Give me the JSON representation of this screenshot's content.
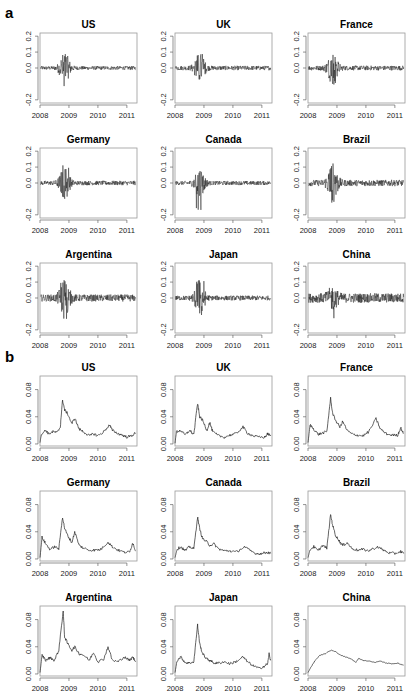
{
  "figure": {
    "panel_a_label": "a",
    "panel_b_label": "b"
  },
  "chart_data": [
    {
      "panel": "a",
      "type": "line",
      "description": "Daily stock index returns by country",
      "x_ticks": [
        "2008",
        "2009",
        "2010",
        "2011"
      ],
      "y_ticks": [
        "-0.2",
        "0.0",
        "0.1",
        "0.2"
      ],
      "ylim": [
        -0.22,
        0.22
      ],
      "xlim": [
        2008.0,
        2011.35
      ],
      "grid": false,
      "legend": null,
      "series": [
        {
          "name": "US",
          "amp_base": 0.012,
          "amp_crisis": 0.09,
          "crisis_min": -0.15,
          "crisis_max": 0.11
        },
        {
          "name": "UK",
          "amp_base": 0.014,
          "amp_crisis": 0.085,
          "crisis_min": -0.1,
          "crisis_max": 0.11
        },
        {
          "name": "France",
          "amp_base": 0.015,
          "amp_crisis": 0.09,
          "crisis_min": -0.12,
          "crisis_max": 0.12
        },
        {
          "name": "Germany",
          "amp_base": 0.014,
          "amp_crisis": 0.09,
          "crisis_min": -0.11,
          "crisis_max": 0.12
        },
        {
          "name": "Canada",
          "amp_base": 0.013,
          "amp_crisis": 0.09,
          "crisis_min": -0.17,
          "crisis_max": 0.1
        },
        {
          "name": "Brazil",
          "amp_base": 0.02,
          "amp_crisis": 0.11,
          "crisis_min": -0.17,
          "crisis_max": 0.14
        },
        {
          "name": "Argentina",
          "amp_base": 0.022,
          "amp_crisis": 0.1,
          "crisis_min": -0.17,
          "crisis_max": 0.11
        },
        {
          "name": "Japan",
          "amp_base": 0.015,
          "amp_crisis": 0.1,
          "crisis_min": -0.12,
          "crisis_max": 0.13
        },
        {
          "name": "China",
          "amp_base": 0.03,
          "amp_crisis": 0.05,
          "crisis_min": -0.13,
          "crisis_max": 0.09
        }
      ]
    },
    {
      "panel": "b",
      "type": "line",
      "description": "Estimated volatility by country",
      "x_ticks": [
        "2008",
        "2009",
        "2010",
        "2011"
      ],
      "y_ticks": [
        "0.00",
        "0.04",
        "0.08"
      ],
      "ylim": [
        -0.003,
        0.1
      ],
      "xlim": [
        2008.0,
        2011.35
      ],
      "grid": false,
      "legend": null,
      "series": [
        {
          "name": "US",
          "x": [
            2008.0,
            2008.05,
            2008.2,
            2008.3,
            2008.45,
            2008.6,
            2008.7,
            2008.78,
            2008.85,
            2008.95,
            2009.1,
            2009.2,
            2009.35,
            2009.5,
            2009.7,
            2009.85,
            2010.0,
            2010.2,
            2010.4,
            2010.5,
            2010.7,
            2010.85,
            2011.0,
            2011.15,
            2011.3
          ],
          "y": [
            0.002,
            0.015,
            0.02,
            0.015,
            0.018,
            0.017,
            0.025,
            0.065,
            0.05,
            0.045,
            0.03,
            0.038,
            0.022,
            0.018,
            0.012,
            0.015,
            0.012,
            0.018,
            0.028,
            0.02,
            0.015,
            0.013,
            0.01,
            0.012,
            0.016
          ]
        },
        {
          "name": "UK",
          "x": [
            2008.0,
            2008.05,
            2008.2,
            2008.35,
            2008.5,
            2008.65,
            2008.78,
            2008.85,
            2008.95,
            2009.1,
            2009.2,
            2009.3,
            2009.5,
            2009.7,
            2009.9,
            2010.1,
            2010.35,
            2010.5,
            2010.7,
            2010.9,
            2011.1,
            2011.2,
            2011.3
          ],
          "y": [
            0.001,
            0.018,
            0.02,
            0.013,
            0.02,
            0.014,
            0.06,
            0.04,
            0.035,
            0.02,
            0.032,
            0.018,
            0.012,
            0.01,
            0.013,
            0.015,
            0.025,
            0.016,
            0.012,
            0.01,
            0.01,
            0.015,
            0.012
          ]
        },
        {
          "name": "France",
          "x": [
            2008.0,
            2008.07,
            2008.2,
            2008.35,
            2008.5,
            2008.65,
            2008.78,
            2008.85,
            2008.95,
            2009.1,
            2009.2,
            2009.35,
            2009.5,
            2009.7,
            2009.9,
            2010.1,
            2010.35,
            2010.5,
            2010.7,
            2010.9,
            2011.1,
            2011.2,
            2011.3
          ],
          "y": [
            0.002,
            0.028,
            0.022,
            0.014,
            0.016,
            0.018,
            0.067,
            0.045,
            0.035,
            0.025,
            0.033,
            0.02,
            0.015,
            0.013,
            0.012,
            0.018,
            0.037,
            0.022,
            0.015,
            0.013,
            0.013,
            0.024,
            0.015
          ]
        },
        {
          "name": "Germany",
          "x": [
            2008.0,
            2008.07,
            2008.2,
            2008.35,
            2008.5,
            2008.65,
            2008.78,
            2008.85,
            2008.95,
            2009.1,
            2009.2,
            2009.35,
            2009.5,
            2009.7,
            2009.9,
            2010.1,
            2010.35,
            2010.5,
            2010.7,
            2010.9,
            2011.1,
            2011.2,
            2011.3
          ],
          "y": [
            0.002,
            0.032,
            0.022,
            0.014,
            0.018,
            0.015,
            0.062,
            0.045,
            0.035,
            0.024,
            0.04,
            0.02,
            0.016,
            0.013,
            0.013,
            0.014,
            0.025,
            0.018,
            0.013,
            0.01,
            0.01,
            0.024,
            0.012
          ]
        },
        {
          "name": "Canada",
          "x": [
            2008.0,
            2008.07,
            2008.2,
            2008.35,
            2008.5,
            2008.65,
            2008.78,
            2008.85,
            2008.95,
            2009.1,
            2009.2,
            2009.35,
            2009.5,
            2009.7,
            2009.9,
            2010.1,
            2010.4,
            2010.6,
            2010.8,
            2011.0,
            2011.2,
            2011.3
          ],
          "y": [
            0.002,
            0.014,
            0.018,
            0.012,
            0.018,
            0.015,
            0.062,
            0.045,
            0.03,
            0.025,
            0.02,
            0.022,
            0.015,
            0.012,
            0.012,
            0.01,
            0.018,
            0.012,
            0.008,
            0.008,
            0.01,
            0.008
          ]
        },
        {
          "name": "Brazil",
          "x": [
            2008.0,
            2008.07,
            2008.2,
            2008.35,
            2008.5,
            2008.65,
            2008.78,
            2008.85,
            2008.95,
            2009.1,
            2009.2,
            2009.35,
            2009.5,
            2009.7,
            2009.9,
            2010.1,
            2010.4,
            2010.6,
            2010.8,
            2011.0,
            2011.2,
            2011.3
          ],
          "y": [
            0.002,
            0.014,
            0.018,
            0.012,
            0.02,
            0.016,
            0.065,
            0.05,
            0.035,
            0.025,
            0.02,
            0.024,
            0.016,
            0.013,
            0.014,
            0.012,
            0.018,
            0.013,
            0.009,
            0.008,
            0.011,
            0.008
          ]
        },
        {
          "name": "Argentina",
          "x": [
            2008.0,
            2008.07,
            2008.2,
            2008.35,
            2008.5,
            2008.65,
            2008.8,
            2008.85,
            2008.95,
            2009.1,
            2009.2,
            2009.35,
            2009.5,
            2009.7,
            2009.85,
            2010.0,
            2010.2,
            2010.35,
            2010.5,
            2010.7,
            2010.9,
            2011.1,
            2011.2,
            2011.3
          ],
          "y": [
            0.002,
            0.028,
            0.02,
            0.024,
            0.02,
            0.035,
            0.093,
            0.055,
            0.045,
            0.035,
            0.04,
            0.03,
            0.028,
            0.02,
            0.032,
            0.018,
            0.022,
            0.04,
            0.02,
            0.018,
            0.025,
            0.02,
            0.025,
            0.018
          ]
        },
        {
          "name": "Japan",
          "x": [
            2008.0,
            2008.07,
            2008.2,
            2008.35,
            2008.5,
            2008.65,
            2008.78,
            2008.85,
            2008.95,
            2009.1,
            2009.2,
            2009.35,
            2009.5,
            2009.7,
            2009.9,
            2010.1,
            2010.35,
            2010.5,
            2010.7,
            2010.9,
            2011.1,
            2011.2,
            2011.25,
            2011.3
          ],
          "y": [
            0.002,
            0.02,
            0.025,
            0.017,
            0.016,
            0.018,
            0.072,
            0.045,
            0.03,
            0.022,
            0.02,
            0.016,
            0.016,
            0.018,
            0.015,
            0.018,
            0.025,
            0.018,
            0.012,
            0.008,
            0.012,
            0.015,
            0.03,
            0.02
          ]
        },
        {
          "name": "China",
          "x": [
            2008.0,
            2008.1,
            2008.25,
            2008.4,
            2008.6,
            2008.8,
            2008.95,
            2009.1,
            2009.3,
            2009.5,
            2009.65,
            2009.75,
            2009.9,
            2010.1,
            2010.3,
            2010.5,
            2010.7,
            2010.9,
            2011.1,
            2011.2,
            2011.3
          ],
          "y": [
            0.002,
            0.01,
            0.02,
            0.027,
            0.03,
            0.035,
            0.033,
            0.028,
            0.025,
            0.022,
            0.017,
            0.023,
            0.02,
            0.019,
            0.017,
            0.019,
            0.016,
            0.015,
            0.016,
            0.014,
            0.013
          ]
        }
      ]
    }
  ]
}
